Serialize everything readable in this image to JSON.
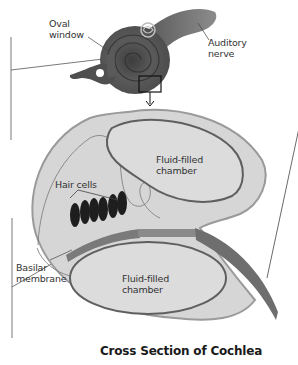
{
  "diagram": {
    "title": "Cross Section of Cochlea",
    "labels": {
      "oval_window_line1": "Oval",
      "oval_window_line2": "window",
      "auditory_nerve_line1": "Auditory",
      "auditory_nerve_line2": "nerve",
      "upper_chamber_line1": "Fluid-filled",
      "upper_chamber_line2": "chamber",
      "hair_cells": "Hair cells",
      "basilar_line1": "Basilar",
      "basilar_line2": "membrane",
      "lower_chamber_line1": "Fluid-filled",
      "lower_chamber_line2": "chamber"
    },
    "hair_cell_count": 6,
    "colors": {
      "background": "#ffffff",
      "cochlea_outer": "#d9d9d9",
      "cochlea_edge": "#9a9a9a",
      "chamber_outline": "#666666",
      "membrane": "#7a7a7a",
      "hair_cells": "#222222",
      "shell_dark": "#4a4a4a",
      "shell_mid": "#6e6e6e",
      "nerve": "#7d7d7d"
    }
  }
}
